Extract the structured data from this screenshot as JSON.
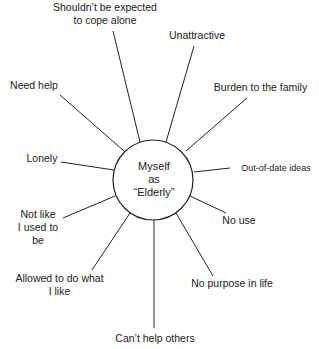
{
  "diagram": {
    "type": "spider-diagram",
    "center": {
      "line1": "Myself",
      "line2": "as",
      "line3": "“Elderly”"
    },
    "spokes": [
      {
        "id": "shouldnt-cope-alone",
        "line1": "Shouldn’t be expected",
        "line2": "to cope alone"
      },
      {
        "id": "unattractive",
        "line1": "Unattractive"
      },
      {
        "id": "burden",
        "line1": "Burden to the family"
      },
      {
        "id": "need-help",
        "line1": "Need help"
      },
      {
        "id": "lonely",
        "line1": "Lonely"
      },
      {
        "id": "out-of-date",
        "line1": "Out-of-date ideas"
      },
      {
        "id": "not-like-used-to",
        "line1": "Not like",
        "line2": "I used to",
        "line3": "be"
      },
      {
        "id": "no-use",
        "line1": "No use"
      },
      {
        "id": "allowed-what-i-like",
        "line1": "Allowed to do what",
        "line2": "I like"
      },
      {
        "id": "no-purpose",
        "line1": "No purpose in life"
      },
      {
        "id": "cant-help-others",
        "line1": "Can’t help others"
      }
    ]
  }
}
